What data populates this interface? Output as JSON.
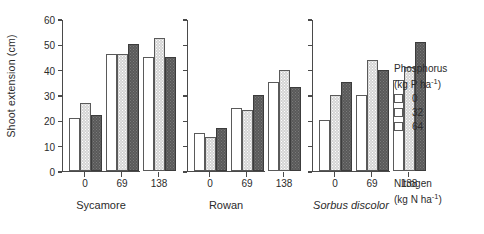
{
  "chart_data": {
    "type": "bar",
    "title": "",
    "ylabel": "Shoot extension (cm)",
    "ylim": [
      0,
      60
    ],
    "yticks": [
      0,
      10,
      20,
      30,
      40,
      50,
      60
    ],
    "grid": false,
    "legend_position": "right",
    "xlabel_lines": [
      "Nitrogen",
      "(kg N ha-1)"
    ],
    "xlabel_unit_base": "(kg N ha",
    "xlabel_unit_sup": "-1",
    "xlabel_unit_tail": ")",
    "legend_title_lines": [
      "Phosphorus",
      "(kg P ha-1)"
    ],
    "legend_title_base": "(kg P ha",
    "legend_title_sup": "-1",
    "legend_title_tail": ")",
    "series_label": "Phosphorus (kg P ha-1)",
    "series": [
      {
        "name": "0",
        "key": "p0",
        "swatch": "white"
      },
      {
        "name": "32",
        "key": "p32",
        "swatch": "light-grey-stipple"
      },
      {
        "name": "64",
        "key": "p64",
        "swatch": "dark-grey"
      }
    ],
    "categories": [
      "0",
      "69",
      "138"
    ],
    "panels": [
      {
        "name": "Sycamore",
        "italic": false,
        "values": {
          "0": [
            21,
            27,
            22
          ],
          "69": [
            46,
            46,
            50
          ],
          "138": [
            45,
            52.5,
            45
          ]
        }
      },
      {
        "name": "Rowan",
        "italic": false,
        "values": {
          "0": [
            15,
            13.5,
            17
          ],
          "69": [
            25,
            24,
            30
          ],
          "138": [
            35,
            40,
            33
          ]
        }
      },
      {
        "name": "Sorbus discolor",
        "italic": true,
        "values": {
          "0": [
            20,
            30,
            35
          ],
          "69": [
            30,
            44,
            40
          ],
          "138": [
            36,
            41,
            51
          ]
        }
      }
    ]
  },
  "colors": {
    "axis": "#4a4a4a",
    "text": "#2b2b2b",
    "bar_p0": "#ffffff",
    "bar_p32": "#d4d4d4",
    "bar_p64": "#595959",
    "background": "#ffffff"
  }
}
